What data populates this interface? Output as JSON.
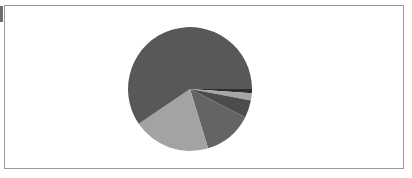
{
  "chart_data": {
    "type": "pie",
    "title": "",
    "legend": [],
    "start_angle_deg": 0,
    "direction": "clockwise",
    "slices": [
      {
        "label": "",
        "value": 1.1,
        "color": "#2e2e2e"
      },
      {
        "label": "",
        "value": 1.9,
        "color": "#a6a6a6"
      },
      {
        "label": "",
        "value": 4.5,
        "color": "#4c4c4c"
      },
      {
        "label": "",
        "value": 12.8,
        "color": "#646464"
      },
      {
        "label": "",
        "value": 20.2,
        "color": "#a3a3a3"
      },
      {
        "label": "",
        "value": 59.5,
        "color": "#585858"
      }
    ],
    "values": [
      1.1,
      1.9,
      4.5,
      12.8,
      20.2,
      59.5
    ],
    "center": [
      190,
      89
    ],
    "radius": 62
  },
  "frame": {
    "border_color": "#9a9a9a",
    "background": "#ffffff"
  }
}
